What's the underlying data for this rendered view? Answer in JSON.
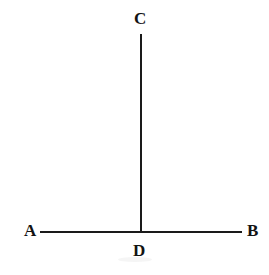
{
  "figure": {
    "background_color": "#ffffff",
    "stroke_color": "#1a1a1a",
    "label_color": "#131313",
    "width": 269,
    "height": 275
  },
  "points": {
    "a": {
      "label": "A",
      "x": 24,
      "y": 222
    },
    "b": {
      "label": "B",
      "x": 247,
      "y": 222
    },
    "c": {
      "label": "C",
      "x": 134,
      "y": 10
    },
    "d": {
      "label": "D",
      "x": 133,
      "y": 242
    }
  },
  "segments": {
    "ab": {
      "name": "AB",
      "x1": 40,
      "y1": 231,
      "x2": 242,
      "y2": 231
    },
    "cd": {
      "name": "CD",
      "x1": 141,
      "y1": 34,
      "x2": 141,
      "y2": 232
    }
  },
  "artifact": {
    "name": "scan-smudge",
    "x": 118,
    "y": 257,
    "width": 34,
    "height": 5
  }
}
